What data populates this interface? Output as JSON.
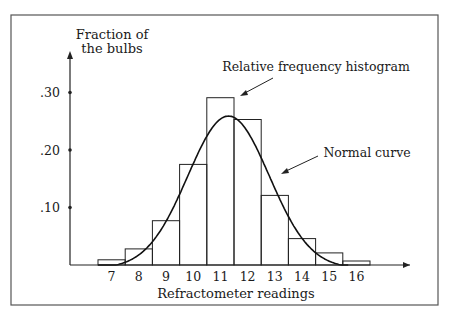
{
  "chart_data": {
    "type": "bar",
    "title": "",
    "xlabel": "Refractometer readings",
    "ylabel": "Fraction of the bulbs",
    "ylabel_lines": [
      "Fraction of",
      "the bulbs"
    ],
    "categories": [
      "7",
      "8",
      "9",
      "10",
      "11",
      "12",
      "13",
      "14",
      "15",
      "16"
    ],
    "series": [
      {
        "name": "Relative frequency histogram",
        "type": "bar",
        "values": [
          0.009,
          0.028,
          0.077,
          0.175,
          0.291,
          0.253,
          0.121,
          0.046,
          0.021,
          0.007
        ]
      },
      {
        "name": "Normal curve",
        "type": "line",
        "mean": 11.3,
        "sd": 1.5,
        "peak": 0.265
      }
    ],
    "yticks": [
      0.1,
      0.2,
      0.3
    ],
    "ytick_labels": [
      ".10",
      ".20",
      ".30"
    ],
    "ylim": [
      0,
      0.37
    ],
    "xlim": [
      6.5,
      17.5
    ],
    "grid": false,
    "legend": "none",
    "annotations": [
      {
        "text": "Relative frequency histogram",
        "points_to": "histogram bar 11-12"
      },
      {
        "text": "Normal curve",
        "points_to": "normal curve right side"
      }
    ]
  }
}
